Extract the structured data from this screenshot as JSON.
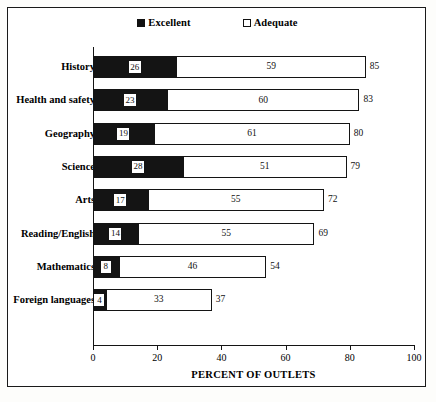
{
  "chart_data": {
    "type": "bar",
    "orientation": "horizontal",
    "stacked": true,
    "title": "",
    "xlabel": "PERCENT OF OUTLETS",
    "ylabel": "",
    "xlim": [
      0,
      100
    ],
    "xticks": [
      0,
      20,
      40,
      60,
      80,
      100
    ],
    "xticklabels": [
      "0",
      "20",
      "40",
      "60",
      "80",
      "100"
    ],
    "grid": false,
    "legend_position": "top-center",
    "categories": [
      "History",
      "Health and safety",
      "Geography",
      "Science",
      "Arts",
      "Reading/English",
      "Mathematics",
      "Foreign languages"
    ],
    "series": [
      {
        "name": "Excellent",
        "color": "#141414",
        "values": [
          26,
          23,
          19,
          28,
          17,
          14,
          8,
          4
        ]
      },
      {
        "name": "Adequate",
        "color": "#ffffff",
        "values": [
          59,
          60,
          61,
          51,
          55,
          55,
          46,
          33
        ]
      }
    ],
    "totals": [
      85,
      83,
      80,
      79,
      72,
      69,
      54,
      37
    ],
    "total_labels": [
      "85",
      "83",
      "80",
      "79",
      "72",
      "69",
      "54",
      "37"
    ]
  },
  "legend": {
    "items": [
      {
        "label": "Excellent",
        "swatch": "filled-square"
      },
      {
        "label": "Adequate",
        "swatch": "outlined-square"
      }
    ]
  },
  "colors": {
    "excellent": "#141414",
    "adequate": "#ffffff",
    "outline": "#141414",
    "background": "#ffffff"
  }
}
